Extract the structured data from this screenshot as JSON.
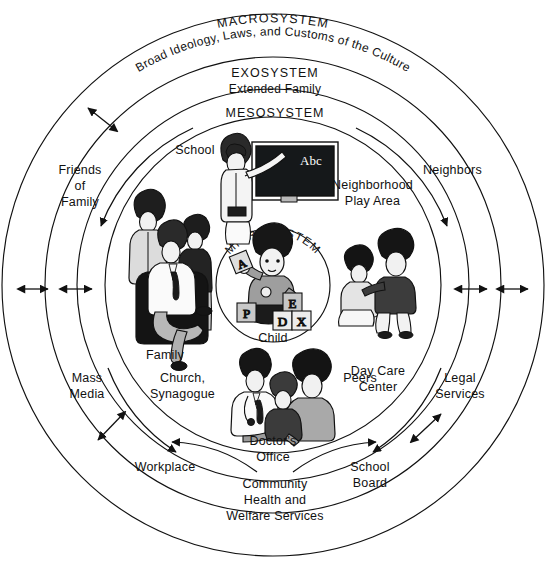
{
  "diagram": {
    "title_visible": false,
    "type": "concentric-ecological-systems-model",
    "colors": {
      "stroke": "#111111",
      "background": "#ffffff",
      "fill_light": "#d8d8d8",
      "fill_mid": "#9a9a9a",
      "fill_dark": "#1a1a1a"
    },
    "rings": [
      {
        "id": "macrosystem",
        "label": "MACROSYSTEM",
        "sublabel": "Broad Ideology, Laws, and Customs of the Culture"
      },
      {
        "id": "exosystem",
        "label": "EXOSYSTEM",
        "sublabel": "Extended Family"
      },
      {
        "id": "mesosystem",
        "label": "MESOSYSTEM",
        "sublabel": ""
      },
      {
        "id": "microsystem",
        "label": "MICROSYSTEM",
        "sublabel": "Child"
      }
    ],
    "nodes": {
      "microsystem": [
        {
          "id": "child",
          "label": "Child"
        }
      ],
      "mesosystem": [
        {
          "id": "school",
          "label": "School"
        },
        {
          "id": "family",
          "label": "Family"
        },
        {
          "id": "neighborhood-play-area",
          "label": "Neighborhood\nPlay Area"
        },
        {
          "id": "day-care-center",
          "label": "Day Care\nCenter"
        },
        {
          "id": "church-synagogue",
          "label": "Church,\nSynagogue"
        },
        {
          "id": "doctors-office",
          "label": "Doctor's\nOffice"
        },
        {
          "id": "peers",
          "label": "Peers"
        }
      ],
      "exosystem": [
        {
          "id": "friends-of-family",
          "label": "Friends\nof\nFamily"
        },
        {
          "id": "neighbors",
          "label": "Neighbors"
        },
        {
          "id": "mass-media",
          "label": "Mass\nMedia"
        },
        {
          "id": "legal-services",
          "label": "Legal\nServices"
        },
        {
          "id": "workplace",
          "label": "Workplace"
        },
        {
          "id": "school-board",
          "label": "School\nBoard"
        },
        {
          "id": "community-health-welfare",
          "label": "Community\nHealth and\nWelfare Services"
        }
      ]
    },
    "labels": {
      "macrosystem": "MACROSYSTEM",
      "macrosystem_sub": "Broad Ideology, Laws, and Customs of the Culture",
      "exosystem": "EXOSYSTEM",
      "exosystem_sub": "Extended Family",
      "mesosystem": "MESOSYSTEM",
      "microsystem": "MICROSYSTEM",
      "child": "Child",
      "school": "School",
      "family": "Family",
      "neighborhood_play_area_l1": "Neighborhood",
      "neighborhood_play_area_l2": "Play Area",
      "neighbors": "Neighbors",
      "friends_of_family_l1": "Friends",
      "friends_of_family_l2": "of",
      "friends_of_family_l3": "Family",
      "day_care_center_l1": "Day Care",
      "day_care_center_l2": "Center",
      "peers": "Peers",
      "mass_media_l1": "Mass",
      "mass_media_l2": "Media",
      "church_synagogue_l1": "Church,",
      "church_synagogue_l2": "Synagogue",
      "legal_services_l1": "Legal",
      "legal_services_l2": "Services",
      "doctors_office_l1": "Doctor's",
      "doctors_office_l2": "Office",
      "workplace": "Workplace",
      "school_board_l1": "School",
      "school_board_l2": "Board",
      "community_l1": "Community",
      "community_l2": "Health and",
      "community_l3": "Welfare Services"
    },
    "illustrations": [
      {
        "id": "teacher-at-blackboard",
        "name": "school-illustration",
        "caption": "School",
        "detail": "teacher pointing at blackboard"
      },
      {
        "id": "blackboard-text",
        "name": "blackboard-text",
        "text": "Abc"
      },
      {
        "id": "family-group",
        "name": "family-illustration",
        "caption": "Family",
        "detail": "seated man with woman and boy behind"
      },
      {
        "id": "child-with-blocks",
        "name": "child-illustration",
        "caption": "Child",
        "detail": "child playing with alphabet blocks"
      },
      {
        "id": "two-children-playing",
        "name": "day-care-illustration",
        "caption": "Day Care Center",
        "detail": "two children playing"
      },
      {
        "id": "doctor-exam",
        "name": "doctors-office-illustration",
        "caption": "Doctor's Office",
        "detail": "doctor with stethoscope examining child on parent's lap"
      }
    ],
    "blocks": [
      {
        "id": "block-a",
        "letter": "A"
      },
      {
        "id": "block-p",
        "letter": "P"
      },
      {
        "id": "block-e",
        "letter": "E"
      },
      {
        "id": "block-d",
        "letter": "D"
      },
      {
        "id": "block-x",
        "letter": "X"
      }
    ],
    "arrows": {
      "bidirectional_horizontal_left": 2,
      "bidirectional_horizontal_right": 2,
      "diagonal_crossing_rings": 2,
      "curved_arcs": 6,
      "description": "double-headed arrows between rings and curved arrows within the mesosystem ring"
    }
  }
}
